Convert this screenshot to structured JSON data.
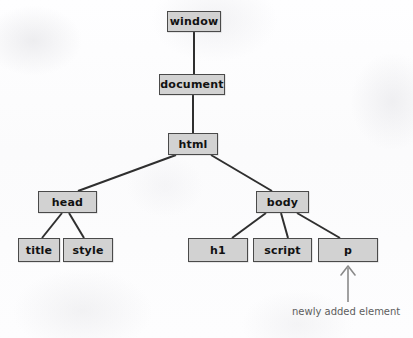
{
  "diagram": {
    "colors": {
      "background": "#fdfdfd",
      "node_fill": "#d2d2d2",
      "node_border": "#4a4a4a",
      "edge": "#2f2f2f",
      "arrow": "#8a8a8a",
      "caption_text": "#5d5d5d",
      "node_text": "#111111"
    },
    "nodes": [
      {
        "id": "window",
        "label": "window",
        "x": 167,
        "y": 11,
        "w": 54,
        "h": 21
      },
      {
        "id": "document",
        "label": "document",
        "x": 159,
        "y": 74,
        "w": 66,
        "h": 21
      },
      {
        "id": "html",
        "label": "html",
        "x": 168,
        "y": 133,
        "w": 50,
        "h": 22
      },
      {
        "id": "head",
        "label": "head",
        "x": 38,
        "y": 191,
        "w": 59,
        "h": 22
      },
      {
        "id": "body",
        "label": "body",
        "x": 256,
        "y": 191,
        "w": 53,
        "h": 22
      },
      {
        "id": "title",
        "label": "title",
        "x": 18,
        "y": 238,
        "w": 42,
        "h": 24
      },
      {
        "id": "style",
        "label": "style",
        "x": 63,
        "y": 238,
        "w": 50,
        "h": 24
      },
      {
        "id": "h1",
        "label": "h1",
        "x": 188,
        "y": 238,
        "w": 60,
        "h": 24
      },
      {
        "id": "script",
        "label": "script",
        "x": 253,
        "y": 238,
        "w": 59,
        "h": 24
      },
      {
        "id": "p",
        "label": "p",
        "x": 318,
        "y": 238,
        "w": 60,
        "h": 24
      }
    ],
    "edges": [
      {
        "from": "window",
        "to": "document",
        "x1": 194,
        "y1": 32,
        "x2": 194,
        "y2": 74
      },
      {
        "from": "document",
        "to": "html",
        "x1": 193,
        "y1": 95,
        "x2": 193,
        "y2": 133
      },
      {
        "from": "html",
        "to": "head",
        "x1": 176,
        "y1": 155,
        "x2": 78,
        "y2": 191
      },
      {
        "from": "html",
        "to": "body",
        "x1": 211,
        "y1": 155,
        "x2": 272,
        "y2": 191
      },
      {
        "from": "head",
        "to": "title",
        "x1": 62,
        "y1": 213,
        "x2": 42,
        "y2": 238
      },
      {
        "from": "head",
        "to": "style",
        "x1": 69,
        "y1": 213,
        "x2": 84,
        "y2": 238
      },
      {
        "from": "body",
        "to": "h1",
        "x1": 266,
        "y1": 213,
        "x2": 232,
        "y2": 238
      },
      {
        "from": "body",
        "to": "script",
        "x1": 281,
        "y1": 213,
        "x2": 288,
        "y2": 238
      },
      {
        "from": "body",
        "to": "p",
        "x1": 297,
        "y1": 213,
        "x2": 340,
        "y2": 238
      }
    ],
    "annotation": {
      "caption": "newly added element",
      "caption_x": 292,
      "caption_y": 307,
      "arrow": {
        "target_node": "p",
        "x": 348,
        "tail_y": 302,
        "head_y": 266
      }
    }
  }
}
